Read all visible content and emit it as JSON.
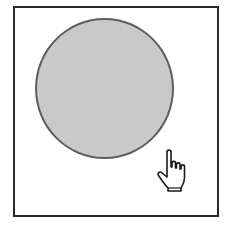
{
  "canvas": {
    "frame_border_color": "#2a2a2a",
    "background_color": "#ffffff"
  },
  "shape": {
    "type": "circle",
    "fill_color": "#c9c9c9",
    "stroke_color": "#5e5e5e"
  },
  "cursor": {
    "icon": "hand-pointer-icon"
  }
}
